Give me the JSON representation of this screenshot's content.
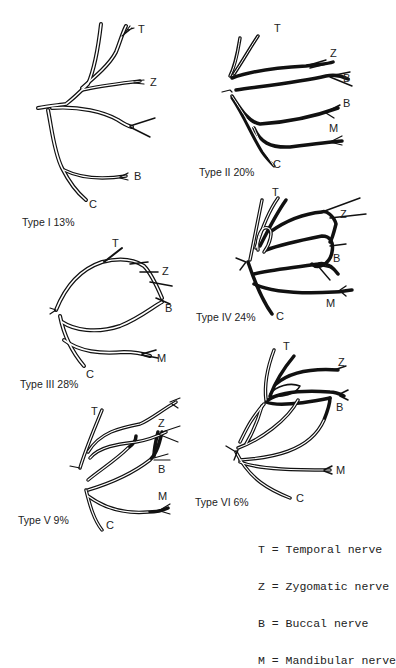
{
  "figure": {
    "panels": [
      {
        "id": "type-1",
        "caption": "Type I 13%",
        "type": "Type I",
        "percent": "13%",
        "labels": {
          "T": "T",
          "Z": "Z",
          "B": "B",
          "C": "C"
        }
      },
      {
        "id": "type-2",
        "caption": "Type II 20%",
        "type": "Type II",
        "percent": "20%",
        "labels": {
          "T": "T",
          "Z": "Z",
          "B1": "B",
          "B2": "B",
          "M": "M",
          "C": "C"
        }
      },
      {
        "id": "type-3",
        "caption": "Type III 28%",
        "type": "Type III",
        "percent": "28%",
        "labels": {
          "T": "T",
          "Z": "Z",
          "B": "B",
          "M": "M",
          "C": "C"
        }
      },
      {
        "id": "type-4",
        "caption": "Type IV 24%",
        "type": "Type IV",
        "percent": "24%",
        "labels": {
          "T": "T",
          "Z": "Z",
          "B": "B",
          "M": "M",
          "C": "C"
        }
      },
      {
        "id": "type-5",
        "caption": "Type V 9%",
        "type": "Type V",
        "percent": "9%",
        "labels": {
          "T": "T",
          "Z": "Z",
          "B": "B",
          "M": "M",
          "C": "C"
        }
      },
      {
        "id": "type-6",
        "caption": "Type VI 6%",
        "type": "Type VI",
        "percent": "6%",
        "labels": {
          "T": "T",
          "Z": "Z",
          "B": "B",
          "M": "M",
          "C": "C"
        }
      }
    ],
    "legend": [
      {
        "key": "T",
        "text": "T = Temporal nerve"
      },
      {
        "key": "Z",
        "text": "Z = Zygomatic nerve"
      },
      {
        "key": "B",
        "text": "B = Buccal nerve"
      },
      {
        "key": "M",
        "text": "M = Mandibular nerve"
      }
    ]
  }
}
